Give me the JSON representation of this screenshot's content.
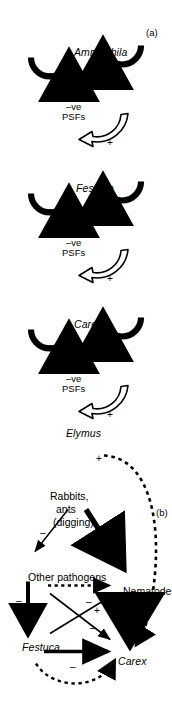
{
  "figure": {
    "orientation": "rotated-90-ccw",
    "background": "#ffffff",
    "ink": "#000000"
  },
  "panels": {
    "a": {
      "label": "(a)",
      "caption_type": "plant-soil feedback succession chain",
      "nodes": [
        {
          "id": "ammophila",
          "name": "Ammophila",
          "italic": true,
          "neg_cycle": true,
          "pos_cycle": true
        },
        {
          "id": "festuca",
          "name": "Festuca",
          "italic": true,
          "neg_cycle": true,
          "pos_cycle": true
        },
        {
          "id": "carex",
          "name": "Carex",
          "italic": true,
          "neg_cycle": true,
          "pos_cycle": true
        },
        {
          "id": "elymus",
          "name": "Elymus",
          "italic": true,
          "neg_cycle": false,
          "pos_cycle": true
        }
      ],
      "cycle_signs": {
        "negative": "–",
        "positive": "+"
      },
      "feedback_labels": [
        {
          "id": "psf-1",
          "line1": "–ve",
          "line2": "PSFs"
        },
        {
          "id": "psf-2",
          "line1": "–ve",
          "line2": "PSFs"
        },
        {
          "id": "psf-3",
          "line1": "–ve",
          "line2": "PSFs"
        }
      ],
      "transitions": [
        {
          "id": "ammophila-to-festuca",
          "sign": "+",
          "style": "hollow-arrow"
        },
        {
          "id": "festuca-to-carex",
          "sign": "+",
          "style": "hollow-arrow"
        },
        {
          "id": "carex-to-elymus",
          "sign": "+",
          "style": "hollow-arrow"
        }
      ]
    },
    "b": {
      "label": "(b)",
      "caption_type": "interaction web",
      "nodes": [
        {
          "id": "rabbits",
          "name": "Rabbits,",
          "name2": "ants",
          "name3": "(digging)",
          "italic": false
        },
        {
          "id": "other-pathogens",
          "name": "Other pathogens",
          "italic": false
        },
        {
          "id": "nematodes",
          "name": "Nematodes",
          "italic": false
        },
        {
          "id": "festuca",
          "name": "Festuca",
          "italic": true
        },
        {
          "id": "carex",
          "name": "Carex",
          "italic": true
        }
      ],
      "edges": [
        {
          "id": "rabbits-to-other-pathogens",
          "from": "rabbits",
          "to": "other-pathogens",
          "sign": "–",
          "style": "thin-solid"
        },
        {
          "id": "rabbits-to-nematodes",
          "from": "rabbits",
          "to": "nematodes",
          "sign": "–",
          "style": "thick-solid"
        },
        {
          "id": "pathogens-to-festuca",
          "from": "other-pathogens",
          "to": "festuca",
          "sign": "–",
          "style": "medium-solid"
        },
        {
          "id": "pathogens-to-carex",
          "from": "other-pathogens",
          "to": "carex",
          "sign": "–",
          "style": "thin-solid"
        },
        {
          "id": "pathogens-to-nematodes",
          "from": "other-pathogens",
          "to": "nematodes",
          "sign": "–",
          "style": "dotted"
        },
        {
          "id": "festuca-to-nematodes",
          "from": "festuca",
          "to": "nematodes",
          "sign": "+",
          "style": "thin-solid"
        },
        {
          "id": "festuca-to-carex",
          "from": "festuca",
          "to": "carex",
          "sign": "–",
          "style": "thick-solid"
        },
        {
          "id": "nematodes-to-carex",
          "from": "nematodes",
          "to": "carex",
          "sign": "–",
          "style": "very-thick-solid"
        },
        {
          "id": "festuca-loop-to-carex",
          "from": "festuca",
          "to": "carex",
          "sign": "",
          "style": "dashed-curve"
        },
        {
          "id": "rabbits-loop-to-carex",
          "from": "rabbits",
          "to": "carex",
          "sign": "+",
          "style": "dashed-curve"
        }
      ]
    }
  }
}
